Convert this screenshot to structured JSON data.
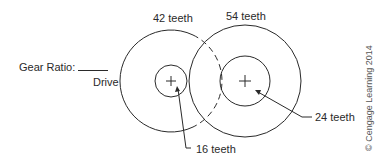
{
  "diagram": {
    "gear_ratio_label": "Gear Ratio:",
    "drive_label": "Drive",
    "left_gear": {
      "outer_teeth_label": "42 teeth",
      "inner_teeth_label": "16 teeth"
    },
    "right_gear": {
      "outer_teeth_label": "54 teeth",
      "inner_teeth_label": "24 teeth"
    },
    "copyright": "© Cengage Learning 2014"
  },
  "colors": {
    "line": "#2a2a2a",
    "background": "#ffffff"
  }
}
